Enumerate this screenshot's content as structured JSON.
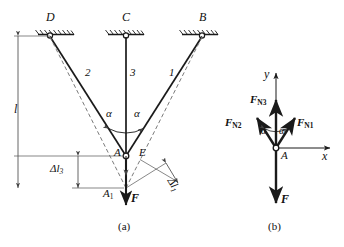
{
  "figure": {
    "caption_a": "(a)",
    "caption_b": "(b)"
  },
  "panel_a": {
    "name": "three-bar-truss-deformation-diagram",
    "supports": [
      {
        "id": "D",
        "label": "D"
      },
      {
        "id": "C",
        "label": "C"
      },
      {
        "id": "B",
        "label": "B"
      }
    ],
    "members": [
      {
        "id": "2",
        "label": "2"
      },
      {
        "id": "3",
        "label": "3"
      },
      {
        "id": "1",
        "label": "1"
      }
    ],
    "angles": [
      {
        "id": "alpha-left",
        "label": "α"
      },
      {
        "id": "alpha-right",
        "label": "α"
      }
    ],
    "nodes": [
      {
        "id": "A",
        "label": "A"
      },
      {
        "id": "A1",
        "label": "A",
        "sub": "1"
      },
      {
        "id": "E",
        "label": "E"
      }
    ],
    "dimensions": [
      {
        "id": "length-l",
        "symbol": "l"
      },
      {
        "id": "delta-l3",
        "symbol": "Δl",
        "sub": "3"
      },
      {
        "id": "delta-l1",
        "symbol": "Δl",
        "sub": "1"
      }
    ],
    "load": {
      "id": "F",
      "label": "F"
    }
  },
  "panel_b": {
    "name": "joint-A-free-body-diagram",
    "axes": [
      {
        "id": "y-axis",
        "label": "y"
      },
      {
        "id": "x-axis",
        "label": "x"
      }
    ],
    "node": {
      "id": "A",
      "label": "A"
    },
    "forces": [
      {
        "id": "FN3",
        "label": "F",
        "sub": "N3"
      },
      {
        "id": "FN2",
        "label": "F",
        "sub": "N2"
      },
      {
        "id": "FN1",
        "label": "F",
        "sub": "N1"
      },
      {
        "id": "F",
        "label": "F",
        "sub": ""
      }
    ],
    "angles": [
      {
        "id": "alpha-left",
        "label": "α"
      },
      {
        "id": "alpha-right",
        "label": "α"
      }
    ]
  },
  "style": {
    "line_color": "#1a1a1a",
    "dash_color": "#7a7a7a",
    "thin_color": "#555555"
  }
}
